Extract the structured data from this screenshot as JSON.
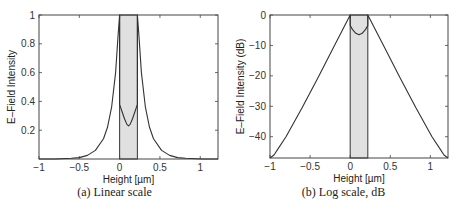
{
  "chart_data": [
    {
      "type": "line",
      "caption": "(a) Linear scale",
      "title": "",
      "xlabel": "Height [µm]",
      "ylabel": "E–Field Intensity",
      "xlim": [
        -1,
        1.22
      ],
      "ylim": [
        0,
        1
      ],
      "xticks": [
        -1,
        -0.5,
        0,
        0.5,
        1
      ],
      "xtick_labels": [
        "−1",
        "−0.5",
        "0",
        "0.5",
        "1"
      ],
      "yticks": [
        0.2,
        0.4,
        0.6,
        0.8,
        1
      ],
      "ytick_labels": [
        "0.2",
        "0.4",
        "0.6",
        "0.8",
        "1"
      ],
      "grid": false,
      "shaded_region": {
        "x0": 0,
        "x1": 0.22,
        "color": "#e0e0e0"
      },
      "series": [
        {
          "name": "E-field intensity",
          "x": [
            -1.0,
            -0.8,
            -0.6,
            -0.5,
            -0.4,
            -0.3,
            -0.2,
            -0.15,
            -0.1,
            -0.05,
            -0.02,
            0.0,
            0.0,
            0.03,
            0.06,
            0.09,
            0.11,
            0.13,
            0.16,
            0.19,
            0.22,
            0.22,
            0.24,
            0.27,
            0.32,
            0.37,
            0.42,
            0.52,
            0.62,
            0.72,
            0.82,
            1.02,
            1.22
          ],
          "y": [
            0.0,
            0.0,
            0.005,
            0.01,
            0.025,
            0.06,
            0.14,
            0.22,
            0.36,
            0.6,
            0.85,
            1.0,
            0.38,
            0.33,
            0.28,
            0.24,
            0.23,
            0.24,
            0.28,
            0.33,
            0.38,
            1.0,
            0.85,
            0.6,
            0.36,
            0.22,
            0.14,
            0.06,
            0.025,
            0.01,
            0.005,
            0.0,
            0.0
          ],
          "color": "#333333"
        }
      ]
    },
    {
      "type": "line",
      "caption": "(b) Log scale, dB",
      "title": "",
      "xlabel": "Height [µm]",
      "ylabel": "E–Field Intensity (dB)",
      "xlim": [
        -1,
        1.22
      ],
      "ylim": [
        -47,
        0
      ],
      "xticks": [
        -1,
        -0.5,
        0,
        0.5,
        1
      ],
      "xtick_labels": [
        "−1",
        "−0.5",
        "0",
        "0.5",
        "1"
      ],
      "yticks": [
        0,
        -10,
        -20,
        -30,
        -40
      ],
      "ytick_labels": [
        "0",
        "−10",
        "−20",
        "−30",
        "−40"
      ],
      "grid": false,
      "shaded_region": {
        "x0": 0,
        "x1": 0.22,
        "color": "#e0e0e0"
      },
      "series": [
        {
          "name": "E-field intensity (dB)",
          "x": [
            -1.0,
            -0.95,
            -0.9,
            -0.8,
            -0.6,
            -0.4,
            -0.2,
            0.0,
            0.0,
            0.03,
            0.07,
            0.11,
            0.15,
            0.19,
            0.22,
            0.22,
            0.42,
            0.62,
            0.82,
            1.02,
            1.12,
            1.17,
            1.22
          ],
          "y": [
            -47,
            -46,
            -44,
            -40,
            -30.5,
            -20.5,
            -10.3,
            0,
            -3.5,
            -4.8,
            -6.0,
            -6.5,
            -6.0,
            -4.8,
            -3.5,
            0,
            -10.3,
            -20.5,
            -30.5,
            -40,
            -44,
            -46,
            -47
          ],
          "color": "#333333"
        }
      ]
    }
  ]
}
